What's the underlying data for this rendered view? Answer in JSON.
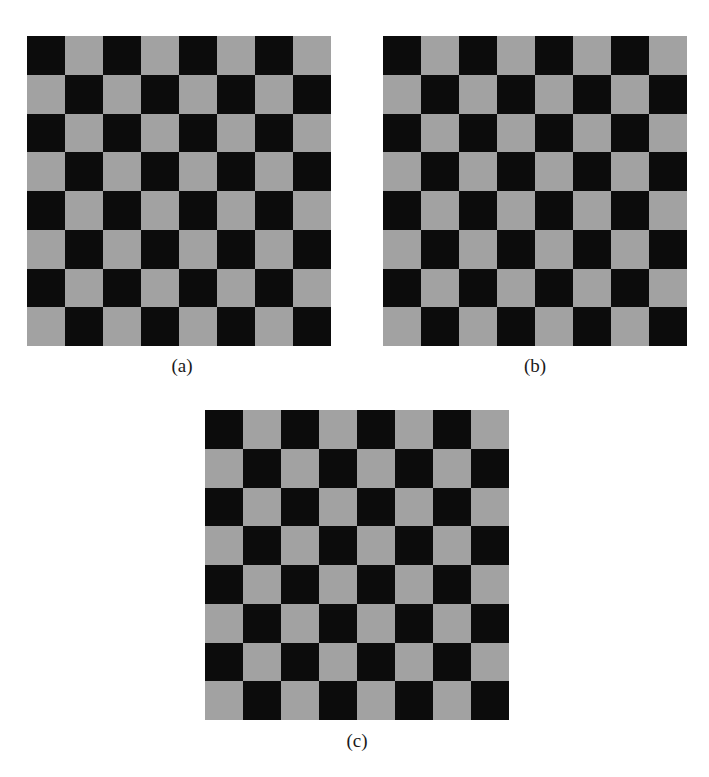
{
  "figure": {
    "colors": {
      "dark": "#0c0c0c",
      "light": "#a2a2a2",
      "background": "#ffffff"
    },
    "grid": {
      "rows": 8,
      "cols": 8
    },
    "panels": [
      {
        "id": "a",
        "caption": "(a)",
        "board": {
          "x": 27,
          "y": 36,
          "width": 304,
          "height": 310,
          "top_left": "dark"
        },
        "caption_pos": {
          "x": 152,
          "y": 356
        }
      },
      {
        "id": "b",
        "caption": "(b)",
        "board": {
          "x": 383,
          "y": 36,
          "width": 304,
          "height": 310,
          "top_left": "dark"
        },
        "caption_pos": {
          "x": 505,
          "y": 356
        }
      },
      {
        "id": "c",
        "caption": "(c)",
        "board": {
          "x": 205,
          "y": 410,
          "width": 304,
          "height": 310,
          "top_left": "dark"
        },
        "caption_pos": {
          "x": 327,
          "y": 731
        }
      }
    ]
  }
}
